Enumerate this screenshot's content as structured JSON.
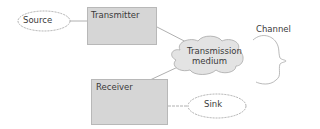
{
  "diagram": {
    "nodes": {
      "source": {
        "label": "Source",
        "shape": "ellipse"
      },
      "transmitter": {
        "label": "Transmitter",
        "shape": "rectangle"
      },
      "medium": {
        "label_line1": "Transmission",
        "label_line2": "medium",
        "shape": "cloud"
      },
      "receiver": {
        "label": "Receiver",
        "shape": "rectangle"
      },
      "sink": {
        "label": "Sink",
        "shape": "ellipse"
      }
    },
    "annotations": {
      "channel": {
        "label": "Channel",
        "shape": "brace"
      }
    },
    "edges": [
      {
        "from": "source",
        "to": "transmitter"
      },
      {
        "from": "transmitter",
        "to": "medium"
      },
      {
        "from": "medium",
        "to": "receiver"
      },
      {
        "from": "receiver",
        "to": "sink"
      }
    ],
    "colors": {
      "box_fill": "#d6d6d6",
      "cloud_fill": "#e3e3e3",
      "line": "#b0b0b0",
      "text": "#3a3a3a"
    }
  }
}
